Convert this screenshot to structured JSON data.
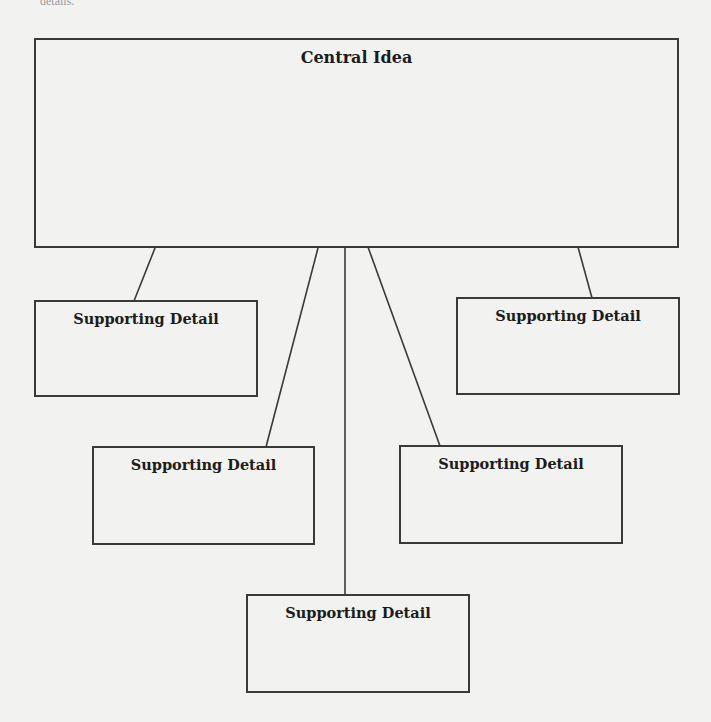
{
  "diagram": {
    "type": "concept-map",
    "header_fragment": "details.",
    "central": {
      "label": "Central Idea",
      "box": {
        "x": 34,
        "y": 38,
        "w": 645,
        "h": 210
      }
    },
    "details": [
      {
        "label": "Supporting Detail",
        "box": {
          "x": 34,
          "y": 300,
          "w": 224,
          "h": 97
        }
      },
      {
        "label": "Supporting Detail",
        "box": {
          "x": 456,
          "y": 297,
          "w": 224,
          "h": 98
        }
      },
      {
        "label": "Supporting Detail",
        "box": {
          "x": 92,
          "y": 446,
          "w": 223,
          "h": 99
        }
      },
      {
        "label": "Supporting Detail",
        "box": {
          "x": 399,
          "y": 445,
          "w": 224,
          "h": 99
        }
      },
      {
        "label": "Supporting Detail",
        "box": {
          "x": 246,
          "y": 594,
          "w": 224,
          "h": 99
        }
      }
    ],
    "connectors": [
      {
        "from": "central",
        "to": "detail-1",
        "x1": 155,
        "y1": 248,
        "x2": 134,
        "y2": 301
      },
      {
        "from": "central",
        "to": "detail-2",
        "x1": 578,
        "y1": 247,
        "x2": 592,
        "y2": 298
      },
      {
        "from": "central",
        "to": "detail-3",
        "x1": 318,
        "y1": 248,
        "x2": 266,
        "y2": 447
      },
      {
        "from": "central",
        "to": "detail-4",
        "x1": 368,
        "y1": 247,
        "x2": 440,
        "y2": 446
      },
      {
        "from": "central",
        "to": "detail-5",
        "x1": 345,
        "y1": 247,
        "x2": 345,
        "y2": 595
      }
    ],
    "colors": {
      "background": "#f2f2f0",
      "stroke": "#3a3a3a",
      "text": "#1c1c1c"
    }
  }
}
